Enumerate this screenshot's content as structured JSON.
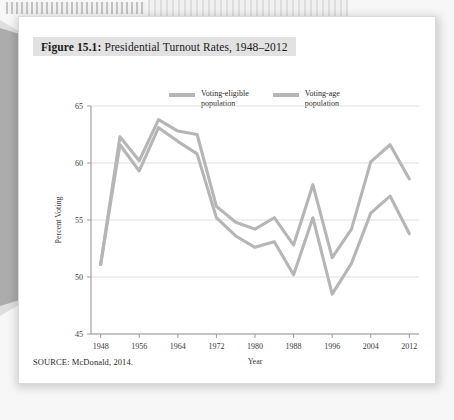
{
  "figure": {
    "number_label": "Figure 15.1:",
    "title": "Presidential Turnout Rates, 1948–2012",
    "source": "SOURCE: McDonald, 2014."
  },
  "legend": {
    "position": "top-center",
    "entries": [
      {
        "label": "Voting-eligible\npopulation",
        "color": "#b6b6b6",
        "swatch_name": "line-swatch"
      },
      {
        "label": "Voting-age\npopulation",
        "color": "#b6b6b6",
        "swatch_name": "line-swatch"
      }
    ]
  },
  "chart_data": {
    "type": "line",
    "title": "Presidential Turnout Rates, 1948–2012",
    "subtitle": "",
    "xlabel": "Year",
    "ylabel": "Percent Voting",
    "xlim": [
      1946,
      2014
    ],
    "ylim": [
      45,
      65
    ],
    "yticks": [
      45,
      50,
      55,
      60,
      65
    ],
    "ytick_labels": [
      "45",
      "50",
      "55",
      "60",
      "65"
    ],
    "xticks": [
      1948,
      1956,
      1964,
      1972,
      1980,
      1988,
      1996,
      2004,
      2012
    ],
    "xtick_labels": [
      "1948",
      "1956",
      "1964",
      "1972",
      "1980",
      "1988",
      "1996",
      "2004",
      "2012"
    ],
    "grid": "horizontal",
    "x": [
      1948,
      1952,
      1956,
      1960,
      1964,
      1968,
      1972,
      1976,
      1980,
      1984,
      1988,
      1992,
      1996,
      2000,
      2004,
      2008,
      2012
    ],
    "series": [
      {
        "name": "Voting-eligible population",
        "color": "#b6b6b6",
        "values": [
          51.1,
          62.3,
          60.2,
          63.8,
          62.8,
          62.5,
          56.2,
          54.8,
          54.2,
          55.2,
          52.8,
          58.1,
          51.7,
          54.2,
          60.1,
          61.6,
          58.6
        ]
      },
      {
        "name": "Voting-age population",
        "color": "#b6b6b6",
        "values": [
          51.1,
          61.6,
          59.3,
          63.1,
          61.9,
          60.8,
          55.2,
          53.6,
          52.6,
          53.1,
          50.2,
          55.2,
          48.5,
          51.2,
          55.6,
          57.1,
          53.8
        ]
      }
    ]
  },
  "decor": {
    "perforation_name": "page-perforation-strip",
    "wedge_name": "page-edge-wedge"
  }
}
